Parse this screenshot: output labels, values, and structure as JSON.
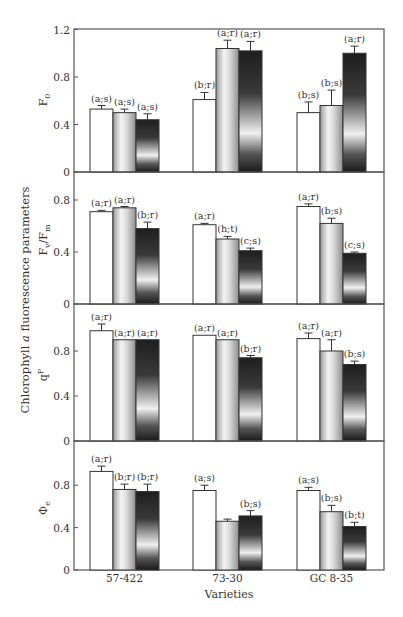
{
  "figure": {
    "shared_ylabel": "Chlorophyll a fluorescence parameters",
    "shared_ylabel_parts": {
      "pre": "Chlorophyll ",
      "italic": "a",
      "post": " fluorescence parameters"
    },
    "xlabel": "Varieties",
    "categories": [
      "57-422",
      "73-30",
      "GC 8-35"
    ],
    "colors": {
      "frame": "#555555",
      "bar_outline": "#333333",
      "white_bar": "#ffffff",
      "gray_bar_edge": "#9a9a9a",
      "gray_bar_center": "#f2f2f2",
      "dark_bar_top": "#1e1e1e",
      "dark_bar_mid": "#f0f0f0"
    }
  },
  "chart_data": [
    {
      "type": "bar",
      "panel": "F0",
      "ylabel": "F₀",
      "ylabel_main": "F",
      "ylabel_sub": "0",
      "ylim": [
        0,
        1.2
      ],
      "yticks": [
        0,
        0.4,
        0.8,
        1.2
      ],
      "ytick_labels": [
        "0",
        "0.4",
        "0.8",
        "1.2"
      ],
      "categories": [
        "57-422",
        "73-30",
        "GC 8-35"
      ],
      "series": [
        {
          "name": "treatment 1 (white)",
          "values": [
            0.53,
            0.61,
            0.5
          ],
          "errors": [
            0.03,
            0.06,
            0.09
          ],
          "labels": [
            "(a;s)",
            "(b;r)",
            "(b;s)"
          ]
        },
        {
          "name": "treatment 2 (gray)",
          "values": [
            0.5,
            1.04,
            0.56
          ],
          "errors": [
            0.03,
            0.07,
            0.13
          ],
          "labels": [
            "(a;s)",
            "(a;r)",
            "(b;s)"
          ]
        },
        {
          "name": "treatment 3 (dark)",
          "values": [
            0.44,
            1.02,
            1.0
          ],
          "errors": [
            0.05,
            0.08,
            0.06
          ],
          "labels": [
            "(a;s)",
            "(a;r)",
            "(a;r)"
          ]
        }
      ]
    },
    {
      "type": "bar",
      "panel": "Fv/Fm",
      "ylabel": "Fv/Fm",
      "ylabel_main": "F",
      "ylabel_sub": "v",
      "ylabel_main2": "/F",
      "ylabel_sub2": "m",
      "ylim": [
        0,
        0.9
      ],
      "yticks": [
        0,
        0.4,
        0.8
      ],
      "ytick_labels": [
        "0",
        "0.4",
        "0.8"
      ],
      "categories": [
        "57-422",
        "73-30",
        "GC 8-35"
      ],
      "series": [
        {
          "name": "treatment 1 (white)",
          "values": [
            0.71,
            0.61,
            0.75
          ],
          "errors": [
            0.01,
            0.01,
            0.02
          ],
          "labels": [
            "(a;r)",
            "(a;r)",
            "(a;r)"
          ]
        },
        {
          "name": "treatment 2 (gray)",
          "values": [
            0.74,
            0.5,
            0.62
          ],
          "errors": [
            0.01,
            0.02,
            0.04
          ],
          "labels": [
            "(a;r)",
            "(h;t)",
            "(b;s)"
          ]
        },
        {
          "name": "treatment 3 (dark)",
          "values": [
            0.58,
            0.41,
            0.39
          ],
          "errors": [
            0.05,
            0.02,
            0.01
          ],
          "labels": [
            "(b;r)",
            "(c;s)",
            "(c;s)"
          ]
        }
      ]
    },
    {
      "type": "bar",
      "panel": "qP",
      "ylabel": "qP",
      "ylabel_main": "q",
      "ylabel_sup": "P",
      "ylim": [
        0,
        1.2
      ],
      "yticks": [
        0,
        0.4,
        0.8
      ],
      "ytick_labels": [
        "0",
        "0.4",
        "0.8"
      ],
      "categories": [
        "57-422",
        "73-30",
        "GC 8-35"
      ],
      "series": [
        {
          "name": "treatment 1 (white)",
          "values": [
            0.98,
            0.94,
            0.91
          ],
          "errors": [
            0.06,
            0.0,
            0.05
          ],
          "labels": [
            "(a;r)",
            "(a;r)",
            "(a;r)"
          ]
        },
        {
          "name": "treatment 2 (gray)",
          "values": [
            0.9,
            0.9,
            0.8
          ],
          "errors": [
            0.0,
            0.0,
            0.1
          ],
          "labels": [
            "(a;r)",
            "(a;r)",
            "(a;r)"
          ]
        },
        {
          "name": "treatment 3 (dark)",
          "values": [
            0.9,
            0.74,
            0.68
          ],
          "errors": [
            0.0,
            0.02,
            0.03
          ],
          "labels": [
            "(a;r)",
            "(b;r)",
            "(b;s)"
          ]
        }
      ]
    },
    {
      "type": "bar",
      "panel": "Φe",
      "ylabel": "Φe",
      "ylabel_main": "Φ",
      "ylabel_sub": "e",
      "ylim": [
        0,
        1.05
      ],
      "yticks": [
        0,
        0.4,
        0.8
      ],
      "ytick_labels": [
        "0",
        "0.4",
        "0.8"
      ],
      "categories": [
        "57-422",
        "73-30",
        "GC 8-35"
      ],
      "series": [
        {
          "name": "treatment 1 (white)",
          "values": [
            0.93,
            0.75,
            0.75
          ],
          "errors": [
            0.05,
            0.05,
            0.03
          ],
          "labels": [
            "(a;r)",
            "(a;s)",
            "(a;s)"
          ]
        },
        {
          "name": "treatment 2 (gray)",
          "values": [
            0.76,
            0.46,
            0.55
          ],
          "errors": [
            0.05,
            0.02,
            0.06
          ],
          "labels": [
            "(b;r)",
            "",
            "(b;s)"
          ]
        },
        {
          "name": "treatment 3 (dark)",
          "values": [
            0.74,
            0.51,
            0.41
          ],
          "errors": [
            0.07,
            0.05,
            0.04
          ],
          "labels": [
            "(b;r)",
            "(b;s)",
            "(b;t)"
          ]
        }
      ]
    }
  ]
}
